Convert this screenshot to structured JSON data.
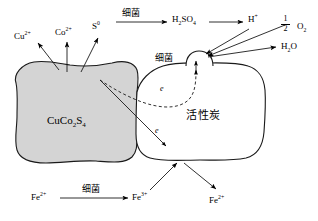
{
  "figure": {
    "type": "mechanism-diagram",
    "background_color": "#ffffff",
    "line_color": "#000000",
    "particle_fill_color": "#d4d4d4"
  },
  "particles": {
    "sulfide": {
      "label": "CuCo₂S₄",
      "label_parts": {
        "pre": "CuCo",
        "sub1": "2",
        "mid": "S",
        "sub2": "4"
      },
      "fill": "#d4d4d4",
      "stroke": "#000000"
    },
    "carbon": {
      "label": "活性炭",
      "fill": "#ffffff",
      "stroke": "#000000"
    }
  },
  "species": {
    "cu_ion": {
      "base": "Cu",
      "charge": "2+"
    },
    "co_ion": {
      "base": "Co",
      "charge": "2+"
    },
    "sulfur": {
      "base": "S",
      "charge": "0"
    },
    "sulfuric_acid": {
      "pre": "H",
      "sub1": "2",
      "mid": "SO",
      "sub2": "4"
    },
    "proton": {
      "base": "H",
      "charge": "+"
    },
    "oxygen": {
      "base": "O",
      "sub": "2",
      "coefficient_numerator": "1",
      "coefficient_denominator": "2"
    },
    "water": {
      "pre": "H",
      "sub1": "2",
      "mid": "O"
    },
    "iron_two_left": {
      "base": "Fe",
      "charge": "2+"
    },
    "iron_three": {
      "base": "Fe",
      "charge": "3+"
    },
    "iron_two_right": {
      "base": "Fe",
      "charge": "2+"
    },
    "electron_upper": "e",
    "electron_lower": "e"
  },
  "annotations": {
    "bacteria_top": "细菌",
    "bacteria_middle": "细菌",
    "bacteria_bottom": "细菌"
  }
}
